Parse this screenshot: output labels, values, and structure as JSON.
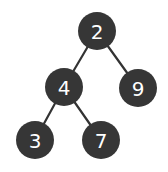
{
  "diagram": {
    "type": "binary-tree",
    "colors": {
      "node_fill": "#363636",
      "node_text": "#ffffff",
      "edge": "#333333",
      "background": "#ffffff"
    },
    "node_radius": 19,
    "nodes": [
      {
        "id": "n2",
        "label": "2",
        "cx": 97,
        "cy": 31
      },
      {
        "id": "n4",
        "label": "4",
        "cx": 64,
        "cy": 87
      },
      {
        "id": "n9",
        "label": "9",
        "cx": 138,
        "cy": 88
      },
      {
        "id": "n3",
        "label": "3",
        "cx": 35,
        "cy": 140
      },
      {
        "id": "n7",
        "label": "7",
        "cx": 101,
        "cy": 140
      }
    ],
    "edges": [
      {
        "from": "n2",
        "to": "n4"
      },
      {
        "from": "n2",
        "to": "n9"
      },
      {
        "from": "n4",
        "to": "n3"
      },
      {
        "from": "n4",
        "to": "n7"
      }
    ]
  }
}
